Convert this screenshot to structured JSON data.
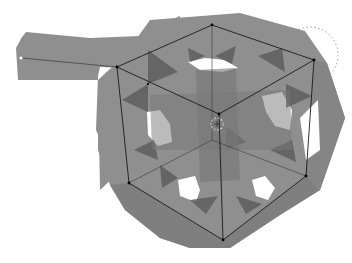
{
  "viewport": {
    "label": "3D viewport",
    "background": "#ffffff",
    "mesh": {
      "label": "Mesh object with arm extension",
      "fill": "#8f8f8f",
      "fill_dark": "#6f6f6f",
      "fill_darker": "#5a5a5a",
      "hole_fill": "#ffffff"
    },
    "wire_cube": {
      "label": "Wireframe cube",
      "stroke": "#1a1a1a",
      "vertices": {
        "top_left": [
          117,
          67
        ],
        "top_back": [
          212,
          25
        ],
        "top_right": [
          314,
          60
        ],
        "top_front": [
          219,
          114
        ],
        "bottom_left": [
          129,
          183
        ],
        "bottom_front": [
          223,
          240
        ],
        "bottom_right": [
          306,
          176
        ],
        "bottom_back": [
          212,
          140
        ]
      }
    },
    "pivot": {
      "label": "3D cursor",
      "position": [
        217,
        124
      ]
    },
    "selection_circle": {
      "label": "Dotted selection circle",
      "center": [
        310,
        55
      ],
      "radius": 28
    },
    "arm_marker": {
      "label": "Arm endpoint marker",
      "position": [
        21,
        58
      ]
    }
  }
}
